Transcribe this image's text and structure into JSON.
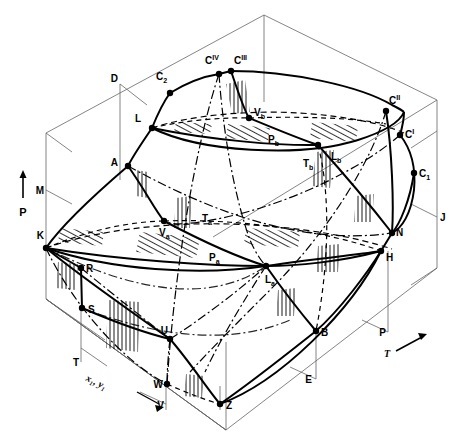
{
  "figure": {
    "type": "3d-phase-diagram",
    "colors": {
      "line": "#000000",
      "thin_line": "#555555",
      "background": "#ffffff"
    }
  },
  "axes": [
    {
      "id": "axis-p",
      "label": "P",
      "arrow": "up"
    },
    {
      "id": "axis-t",
      "label": "T",
      "arrow": "right"
    },
    {
      "id": "axis-xy",
      "label": "x₁, y₁",
      "arrow": "down-right"
    }
  ],
  "points": [
    {
      "id": "D",
      "base": "D",
      "sub": "",
      "sup": "",
      "x": 120,
      "y": 84,
      "lx": 118,
      "ly": 82,
      "dot": false,
      "anchor": "end"
    },
    {
      "id": "C2",
      "base": "C",
      "sub": "2",
      "sup": "",
      "x": 170,
      "y": 93,
      "lx": 156,
      "ly": 80,
      "dot": true,
      "anchor": "start"
    },
    {
      "id": "CIV",
      "base": "C",
      "sub": "",
      "sup": "IV",
      "x": 219,
      "y": 74,
      "lx": 205,
      "ly": 64,
      "dot": true,
      "anchor": "start"
    },
    {
      "id": "CIII",
      "base": "C",
      "sub": "",
      "sup": "III",
      "x": 231,
      "y": 71,
      "lx": 234,
      "ly": 64,
      "dot": true,
      "anchor": "start"
    },
    {
      "id": "L",
      "base": "L",
      "sub": "",
      "sup": "",
      "x": 152,
      "y": 128,
      "lx": 141,
      "ly": 122,
      "dot": true,
      "anchor": "end"
    },
    {
      "id": "Vb",
      "base": "V",
      "sub": "b",
      "sup": "",
      "x": 249,
      "y": 118,
      "lx": 254,
      "ly": 116,
      "dot": true,
      "anchor": "start"
    },
    {
      "id": "Cdbl",
      "base": "C",
      "sub": "",
      "sup": "II",
      "x": 386,
      "y": 111,
      "lx": 389,
      "ly": 104,
      "dot": true,
      "anchor": "start"
    },
    {
      "id": "Csgl",
      "base": "C",
      "sub": "",
      "sup": "I",
      "x": 400,
      "y": 135,
      "lx": 405,
      "ly": 138,
      "dot": true,
      "anchor": "start"
    },
    {
      "id": "C1",
      "base": "C",
      "sub": "1",
      "sup": "",
      "x": 414,
      "y": 173,
      "lx": 419,
      "ly": 177,
      "dot": true,
      "anchor": "start"
    },
    {
      "id": "A",
      "base": "A",
      "sub": "",
      "sup": "",
      "x": 128,
      "y": 166,
      "lx": 118,
      "ly": 166,
      "dot": true,
      "anchor": "end"
    },
    {
      "id": "M",
      "base": "M",
      "sub": "",
      "sup": "",
      "x": 46,
      "y": 190,
      "lx": 44,
      "ly": 194,
      "dot": false,
      "anchor": "end"
    },
    {
      "id": "Lb",
      "base": "L",
      "sub": "b",
      "sup": "",
      "x": 318,
      "y": 145,
      "lx": 331,
      "ly": 160,
      "dot": true,
      "anchor": "start"
    },
    {
      "id": "K",
      "base": "K",
      "sub": "",
      "sup": "",
      "x": 46,
      "y": 248,
      "lx": 44,
      "ly": 239,
      "dot": true,
      "anchor": "end"
    },
    {
      "id": "Va",
      "base": "V",
      "sub": "a",
      "sup": "",
      "x": 164,
      "y": 221,
      "lx": 159,
      "ly": 236,
      "dot": true,
      "anchor": "start"
    },
    {
      "id": "N",
      "base": "N",
      "sub": "",
      "sup": "",
      "x": 392,
      "y": 233,
      "lx": 396,
      "ly": 236,
      "dot": true,
      "anchor": "start"
    },
    {
      "id": "J",
      "base": "J",
      "sub": "",
      "sup": "",
      "x": 437,
      "y": 217,
      "lx": 440,
      "ly": 221,
      "dot": false,
      "anchor": "start"
    },
    {
      "id": "H",
      "base": "H",
      "sub": "",
      "sup": "",
      "x": 381,
      "y": 251,
      "lx": 386,
      "ly": 261,
      "dot": true,
      "anchor": "start"
    },
    {
      "id": "La",
      "base": "L",
      "sub": "a",
      "sup": "",
      "x": 266,
      "y": 266,
      "lx": 265,
      "ly": 283,
      "dot": true,
      "anchor": "start"
    },
    {
      "id": "R",
      "base": "R",
      "sub": "",
      "sup": "",
      "x": 81,
      "y": 268,
      "lx": 86,
      "ly": 272,
      "dot": true,
      "anchor": "start"
    },
    {
      "id": "S",
      "base": "S",
      "sub": "",
      "sup": "",
      "x": 82,
      "y": 308,
      "lx": 88,
      "ly": 313,
      "dot": true,
      "anchor": "start"
    },
    {
      "id": "T",
      "base": "T",
      "sub": "",
      "sup": "",
      "x": 81,
      "y": 362,
      "lx": 79,
      "ly": 366,
      "dot": false,
      "anchor": "end"
    },
    {
      "id": "U",
      "base": "U",
      "sub": "",
      "sup": "",
      "x": 170,
      "y": 339,
      "lx": 168,
      "ly": 334,
      "dot": true,
      "anchor": "end"
    },
    {
      "id": "W",
      "base": "W",
      "sub": "",
      "sup": "",
      "x": 167,
      "y": 384,
      "lx": 163,
      "ly": 388,
      "dot": true,
      "anchor": "end"
    },
    {
      "id": "V",
      "base": "V",
      "sub": "",
      "sup": "",
      "x": 166,
      "y": 403,
      "lx": 164,
      "ly": 409,
      "dot": false,
      "anchor": "end"
    },
    {
      "id": "Z",
      "base": "Z",
      "sub": "",
      "sup": "",
      "x": 220,
      "y": 404,
      "lx": 226,
      "ly": 409,
      "dot": true,
      "anchor": "start"
    },
    {
      "id": "B",
      "base": "B",
      "sub": "",
      "sup": "",
      "x": 316,
      "y": 331,
      "lx": 321,
      "ly": 336,
      "dot": true,
      "anchor": "start"
    },
    {
      "id": "E",
      "base": "E",
      "sub": "",
      "sup": "",
      "x": 314,
      "y": 378,
      "lx": 312,
      "ly": 383,
      "dot": false,
      "anchor": "end"
    },
    {
      "id": "P",
      "base": "P",
      "sub": "",
      "sup": "",
      "x": 388,
      "y": 331,
      "lx": 386,
      "ly": 336,
      "dot": false,
      "anchor": "end"
    }
  ],
  "region_labels": [
    {
      "id": "Pb",
      "base": "P",
      "sub": "b",
      "x": 268,
      "y": 143
    },
    {
      "id": "Tb",
      "base": "T",
      "sub": "b",
      "x": 303,
      "y": 167
    },
    {
      "id": "Ta",
      "base": "T",
      "sub": "a",
      "x": 202,
      "y": 222
    },
    {
      "id": "Pa",
      "base": "P",
      "sub": "a",
      "x": 209,
      "y": 261
    }
  ]
}
